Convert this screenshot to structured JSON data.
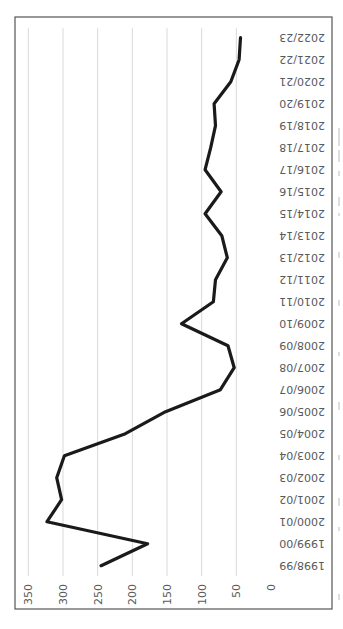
{
  "chart_data": {
    "type": "line",
    "orientation": "rotated-90-clockwise",
    "title": "",
    "xlabel": "",
    "ylabel": "",
    "categories": [
      "1998/99",
      "1999/00",
      "2000/01",
      "2001/02",
      "2002/03",
      "2003/04",
      "2004/05",
      "2005/06",
      "2006/07",
      "2007/08",
      "2008/09",
      "2009/10",
      "2010/11",
      "2011/12",
      "2012/13",
      "2013/14",
      "2014/15",
      "2015/16",
      "2016/17",
      "2017/18",
      "2018/19",
      "2019/20",
      "2020/21",
      "2021/22",
      "2022/23"
    ],
    "series": [
      {
        "name": "Series 1",
        "color": "#1a1a1a",
        "values": [
          245,
          178,
          323,
          302,
          309,
          298,
          210,
          152,
          73,
          53,
          62,
          129,
          83,
          80,
          63,
          71,
          95,
          72,
          95,
          87,
          80,
          82,
          58,
          46,
          44
        ]
      }
    ],
    "ylim": [
      0,
      350
    ],
    "yticks": [
      0,
      50,
      100,
      150,
      200,
      250,
      300,
      350
    ],
    "ytick_labels": [
      "0",
      "50",
      "100",
      "150",
      "200",
      "250",
      "300",
      "350"
    ],
    "grid": true,
    "legend": "none"
  },
  "colors": {
    "gridline": "#d9d9d9",
    "frame": "#555555",
    "tick_text": "#595959",
    "line": "#1a1a1a"
  }
}
